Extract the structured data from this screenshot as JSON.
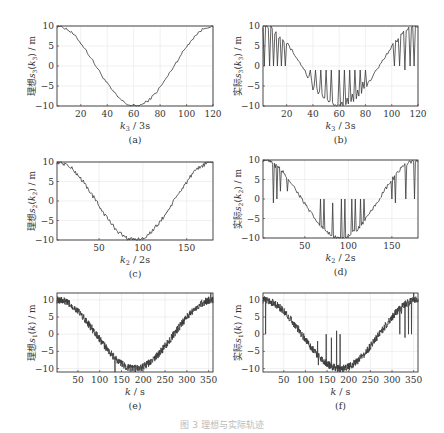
{
  "figure_caption": "图 3  理想与实际轨迹",
  "chart_data": [
    {
      "id": "a",
      "type": "line",
      "panel_label": "(a)",
      "ylabel": "理想 s3(k3) / m",
      "ylabel_prefix": "理想",
      "ylabel_var": "s",
      "ylabel_sub": "3",
      "ylabel_arg": "k",
      "ylabel_argsub": "3",
      "xlabel": "k3 / 3s",
      "xlabel_var": "k",
      "xlabel_sub": "3",
      "xlabel_unit": "3s",
      "xlim": [
        2,
        120
      ],
      "ylim": [
        -10,
        10
      ],
      "xticks": [
        20,
        40,
        60,
        80,
        100,
        120
      ],
      "yticks": [
        10,
        5,
        0,
        -5,
        -10
      ],
      "grid": true,
      "series": [
        {
          "name": "ideal",
          "shape": "cosine",
          "amplitude": 10,
          "period": 118,
          "noise": 0.35,
          "spikes": []
        }
      ],
      "box": {
        "x": 57,
        "y": 26,
        "w": 156,
        "h": 80
      }
    },
    {
      "id": "b",
      "type": "line",
      "panel_label": "(b)",
      "ylabel": "实际 s3(k3) / m",
      "ylabel_prefix": "实际",
      "ylabel_var": "s",
      "ylabel_sub": "3",
      "ylabel_arg": "k",
      "ylabel_argsub": "3",
      "xlabel": "k3 / 3s",
      "xlabel_var": "k",
      "xlabel_sub": "3",
      "xlabel_unit": "3s",
      "xlim": [
        2,
        120
      ],
      "ylim": [
        -10,
        10
      ],
      "xticks": [
        20,
        40,
        60,
        80,
        100,
        120
      ],
      "yticks": [
        10,
        5,
        0,
        -5,
        -10
      ],
      "grid": true,
      "series": [
        {
          "name": "actual",
          "shape": "cosine",
          "amplitude": 10,
          "period": 118,
          "noise": 0.4,
          "spikes": [
            [
              3,
              0
            ],
            [
              5,
              10
            ],
            [
              7,
              0
            ],
            [
              8,
              10
            ],
            [
              10,
              0
            ],
            [
              11,
              8
            ],
            [
              13,
              0
            ],
            [
              14,
              7
            ],
            [
              16,
              0
            ],
            [
              18,
              6
            ],
            [
              19,
              0
            ],
            [
              34,
              -1
            ],
            [
              36,
              -3
            ],
            [
              38,
              -1
            ],
            [
              40,
              -6
            ],
            [
              42,
              -1
            ],
            [
              44,
              -7
            ],
            [
              46,
              -1
            ],
            [
              48,
              -8
            ],
            [
              50,
              -1
            ],
            [
              52,
              -9
            ],
            [
              54,
              -1
            ],
            [
              58,
              -10
            ],
            [
              60,
              -1
            ],
            [
              62,
              -9
            ],
            [
              64,
              -1
            ],
            [
              66,
              -8
            ],
            [
              68,
              -1
            ],
            [
              70,
              -7
            ],
            [
              72,
              -1
            ],
            [
              74,
              -6
            ],
            [
              76,
              -1
            ],
            [
              78,
              -4
            ],
            [
              80,
              -1
            ],
            [
              100,
              5
            ],
            [
              102,
              0
            ],
            [
              104,
              6
            ],
            [
              106,
              0
            ],
            [
              108,
              8
            ],
            [
              110,
              -1
            ],
            [
              112,
              9
            ],
            [
              114,
              0
            ],
            [
              116,
              10
            ],
            [
              117,
              0
            ],
            [
              118,
              10
            ]
          ]
        }
      ],
      "box": {
        "x": 263,
        "y": 26,
        "w": 155,
        "h": 80
      }
    },
    {
      "id": "c",
      "type": "line",
      "panel_label": "(c)",
      "ylabel": "理想 s2(k2) / m",
      "ylabel_prefix": "理想",
      "ylabel_var": "s",
      "ylabel_sub": "2",
      "ylabel_arg": "k",
      "ylabel_argsub": "2",
      "xlabel": "k2 / 2s",
      "xlabel_var": "k",
      "xlabel_sub": "2",
      "xlabel_unit": "2s",
      "xlim": [
        2,
        180
      ],
      "ylim": [
        -10,
        10
      ],
      "xticks": [
        50,
        100,
        150
      ],
      "yticks": [
        10,
        5,
        0,
        -5,
        -10
      ],
      "grid": true,
      "series": [
        {
          "name": "ideal",
          "shape": "cosine",
          "amplitude": 10,
          "period": 178,
          "noise": 0.55,
          "spikes": []
        }
      ],
      "box": {
        "x": 57,
        "y": 162,
        "w": 156,
        "h": 78
      }
    },
    {
      "id": "d",
      "type": "line",
      "panel_label": "(d)",
      "ylabel": "实际 s2(k2) / m",
      "ylabel_prefix": "实际",
      "ylabel_var": "s",
      "ylabel_sub": "2",
      "ylabel_arg": "k",
      "ylabel_argsub": "2",
      "xlabel": "k2 / 2s",
      "xlabel_var": "k",
      "xlabel_sub": "2",
      "xlabel_unit": "2s",
      "xlim": [
        2,
        180
      ],
      "ylim": [
        -10,
        10
      ],
      "xticks": [
        50,
        100,
        150
      ],
      "yticks": [
        10,
        5,
        0,
        -5,
        -10
      ],
      "grid": true,
      "series": [
        {
          "name": "actual",
          "shape": "cosine",
          "amplitude": 10,
          "period": 178,
          "noise": 0.5,
          "spikes": [
            [
              14,
              -1
            ],
            [
              16,
              8
            ],
            [
              18,
              0
            ],
            [
              20,
              8
            ],
            [
              22,
              2
            ],
            [
              30,
              2
            ],
            [
              68,
              0
            ],
            [
              70,
              -7
            ],
            [
              72,
              0
            ],
            [
              82,
              -1
            ],
            [
              92,
              0
            ],
            [
              94,
              -10
            ],
            [
              96,
              0
            ],
            [
              100,
              -9
            ],
            [
              104,
              0
            ],
            [
              106,
              -8
            ],
            [
              108,
              0
            ],
            [
              112,
              -7
            ],
            [
              114,
              0
            ],
            [
              118,
              0
            ],
            [
              150,
              0
            ],
            [
              152,
              5
            ],
            [
              154,
              -1
            ],
            [
              166,
              0
            ],
            [
              168,
              9
            ],
            [
              176,
              0
            ]
          ]
        }
      ],
      "box": {
        "x": 263,
        "y": 160,
        "w": 155,
        "h": 78
      }
    },
    {
      "id": "e",
      "type": "line",
      "panel_label": "(e)",
      "ylabel": "理想 s1(k) / m",
      "ylabel_prefix": "理想",
      "ylabel_var": "s",
      "ylabel_sub": "1",
      "ylabel_arg": "k",
      "ylabel_argsub": "",
      "xlabel": "k / s",
      "xlabel_var": "k",
      "xlabel_sub": "",
      "xlabel_unit": "s",
      "xlim": [
        2,
        360
      ],
      "ylim": [
        -11,
        12
      ],
      "xticks": [
        50,
        100,
        150,
        200,
        250,
        300,
        350
      ],
      "yticks": [
        10,
        5,
        0,
        -5,
        -10
      ],
      "grid": true,
      "series": [
        {
          "name": "ideal",
          "shape": "cosine",
          "amplitude": 10,
          "period": 358,
          "noise": 1.1,
          "spikes": [
            [
              135,
              -11
            ],
            [
              355,
              12
            ]
          ]
        }
      ],
      "box": {
        "x": 57,
        "y": 293,
        "w": 156,
        "h": 79
      }
    },
    {
      "id": "f",
      "type": "line",
      "panel_label": "(f)",
      "ylabel": "实际 s1(k) / m",
      "ylabel_prefix": "实际",
      "ylabel_var": "s",
      "ylabel_sub": "1",
      "ylabel_arg": "k",
      "ylabel_argsub": "",
      "xlabel": "k / s",
      "xlabel_var": "k",
      "xlabel_sub": "",
      "xlabel_unit": "s",
      "xlim": [
        2,
        360
      ],
      "ylim": [
        -11,
        12
      ],
      "xticks": [
        50,
        100,
        150,
        200,
        250,
        300,
        350
      ],
      "yticks": [
        10,
        5,
        0,
        -5,
        -10
      ],
      "grid": true,
      "series": [
        {
          "name": "actual",
          "shape": "cosine",
          "amplitude": 10,
          "period": 358,
          "noise": 1.1,
          "spikes": [
            [
              8,
              0
            ],
            [
              128,
              -2
            ],
            [
              130,
              -9
            ],
            [
              148,
              0
            ],
            [
              150,
              -9
            ],
            [
              160,
              -1
            ],
            [
              172,
              1
            ],
            [
              174,
              -9
            ],
            [
              180,
              0
            ],
            [
              318,
              0
            ],
            [
              322,
              6
            ],
            [
              330,
              -1
            ],
            [
              338,
              0
            ],
            [
              345,
              0
            ],
            [
              350,
              12
            ]
          ]
        }
      ],
      "box": {
        "x": 263,
        "y": 293,
        "w": 155,
        "h": 79
      }
    }
  ]
}
